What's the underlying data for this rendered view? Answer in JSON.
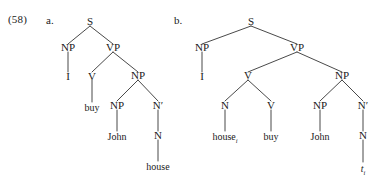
{
  "example": {
    "number": "(58)",
    "label_a": "a.",
    "label_b": "b."
  },
  "trees": {
    "a": {
      "nodes": {
        "s": "S",
        "np_subj": "NP",
        "vp": "VP",
        "i": "I",
        "v": "V",
        "np_obj": "NP",
        "buy": "buy",
        "np_spec": "NP",
        "nbar": "N′",
        "john": "John",
        "n": "N",
        "house": "house"
      }
    },
    "b": {
      "nodes": {
        "s": "S",
        "np_subj": "NP",
        "vp": "VP",
        "i": "I",
        "v": "V",
        "np_obj": "NP",
        "n_incorp": "N",
        "v_head": "V",
        "house": "house",
        "house_sub": "i",
        "buy": "buy",
        "np_spec": "NP",
        "nbar": "N′",
        "john": "John",
        "n": "N",
        "trace": "t",
        "trace_sub": "i"
      }
    }
  },
  "colors": {
    "ink": "#1a1a1a",
    "background": "#ffffff"
  }
}
